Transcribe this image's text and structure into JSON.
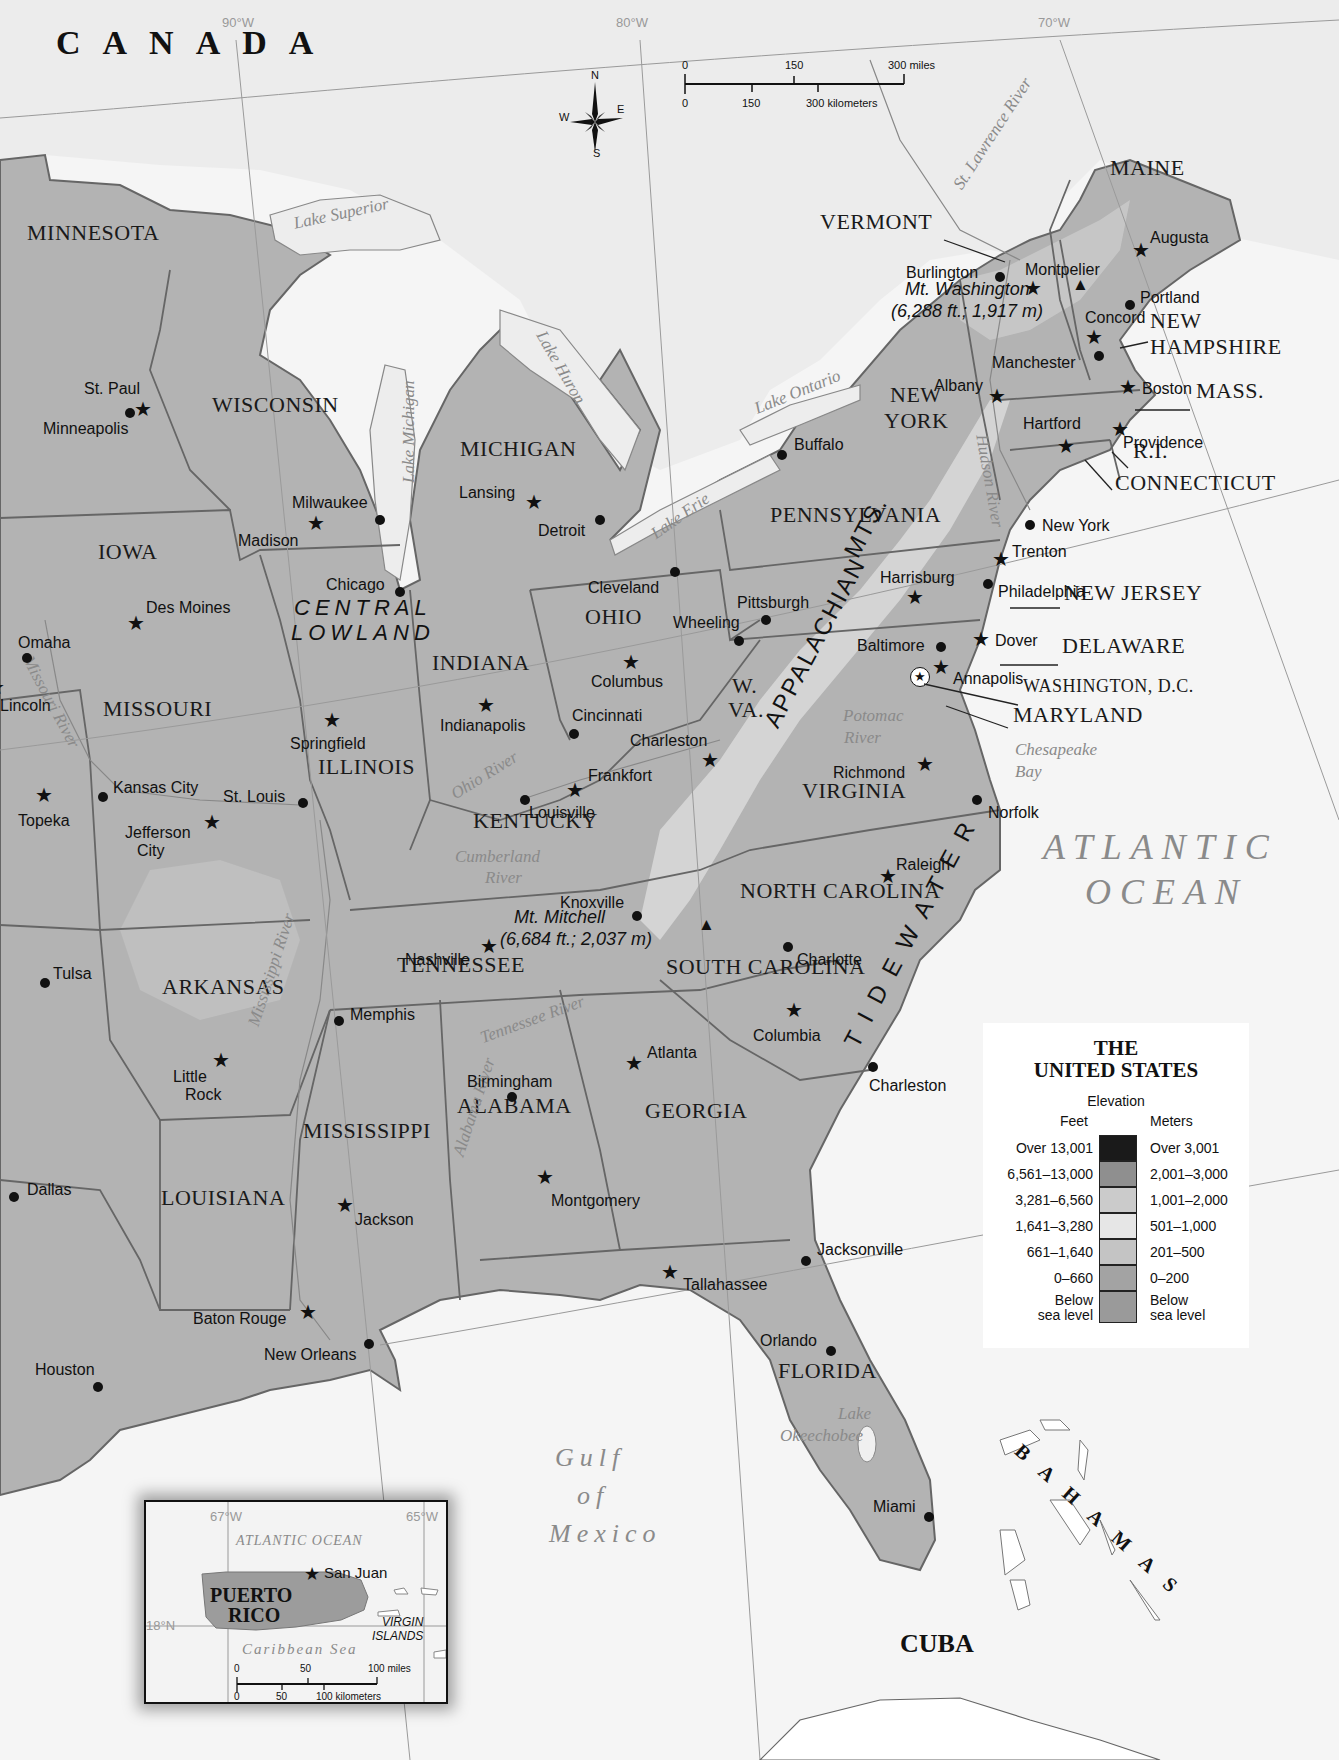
{
  "map": {
    "title": "THE UNITED STATES",
    "countries": [
      {
        "name": "CANADA",
        "x": 56,
        "y": 60,
        "size": 34,
        "spacing": 22
      },
      {
        "name": "CUBA",
        "x": 900,
        "y": 1657,
        "size": 26,
        "spacing": 0
      },
      {
        "name": "BAHAMAS",
        "x": 1025,
        "y": 1460,
        "size": 20,
        "spacing": 18,
        "rotate": 42
      }
    ],
    "oceans": [
      {
        "name": "ATLANTIC",
        "x": 1043,
        "y": 865
      },
      {
        "name": "OCEAN",
        "x": 1085,
        "y": 910
      }
    ],
    "gulf": {
      "lines": [
        "Gulf",
        "of",
        "Mexico"
      ],
      "x": 555,
      "y": 1445
    },
    "graticule": [
      {
        "label": "90°W",
        "x": 222,
        "y": 16
      },
      {
        "label": "80°W",
        "x": 616,
        "y": 16
      },
      {
        "label": "70°W",
        "x": 1038,
        "y": 16
      }
    ],
    "scale_bar": {
      "miles": [
        "0",
        "150",
        "300 miles"
      ],
      "kilometers": [
        "0",
        "150",
        "300 kilometers"
      ]
    },
    "compass": {
      "n": "N",
      "s": "S",
      "e": "E",
      "w": "W"
    },
    "states": [
      {
        "name": "MINNESOTA",
        "x": 27,
        "y": 242
      },
      {
        "name": "WISCONSIN",
        "x": 212,
        "y": 414
      },
      {
        "name": "MICHIGAN",
        "x": 460,
        "y": 458
      },
      {
        "name": "IOWA",
        "x": 98,
        "y": 561
      },
      {
        "name": "MISSOURI",
        "x": 103,
        "y": 718
      },
      {
        "name": "ILLINOIS",
        "x": 318,
        "y": 776
      },
      {
        "name": "INDIANA",
        "x": 432,
        "y": 672
      },
      {
        "name": "OHIO",
        "x": 585,
        "y": 626
      },
      {
        "name": "KENTUCKY",
        "x": 473,
        "y": 830
      },
      {
        "name": "TENNESSEE",
        "x": 397,
        "y": 974
      },
      {
        "name": "ARKANSAS",
        "x": 162,
        "y": 996
      },
      {
        "name": "MISSISSIPPI",
        "x": 303,
        "y": 1140
      },
      {
        "name": "LOUISIANA",
        "x": 161,
        "y": 1207
      },
      {
        "name": "ALABAMA",
        "x": 457,
        "y": 1115
      },
      {
        "name": "GEORGIA",
        "x": 645,
        "y": 1120
      },
      {
        "name": "FLORIDA",
        "x": 778,
        "y": 1380
      },
      {
        "name": "SOUTH CAROLINA",
        "x": 666,
        "y": 976
      },
      {
        "name": "NORTH CAROLINA",
        "x": 740,
        "y": 900
      },
      {
        "name": "VIRGINIA",
        "x": 802,
        "y": 800
      },
      {
        "name": "PENNSYLVANIA",
        "x": 770,
        "y": 524
      },
      {
        "name": "NEW",
        "x": 890,
        "y": 404
      },
      {
        "name": "YORK",
        "x": 884,
        "y": 430
      },
      {
        "name": "MAINE",
        "x": 1110,
        "y": 177
      },
      {
        "name": "VERMONT",
        "x": 820,
        "y": 231
      },
      {
        "name": "NEW",
        "x": 1150,
        "y": 330
      },
      {
        "name": "HAMPSHIRE",
        "x": 1150,
        "y": 356
      },
      {
        "name": "MASS.",
        "x": 1196,
        "y": 400
      },
      {
        "name": "R.I.",
        "x": 1133,
        "y": 460
      },
      {
        "name": "CONNECTICUT",
        "x": 1115,
        "y": 492
      },
      {
        "name": "NEW JERSEY",
        "x": 1064,
        "y": 602
      },
      {
        "name": "DELAWARE",
        "x": 1062,
        "y": 655
      },
      {
        "name": "WASHINGTON, D.C.",
        "x": 1023,
        "y": 697,
        "small": true
      },
      {
        "name": "MARYLAND",
        "x": 1013,
        "y": 724
      },
      {
        "name": "W.",
        "x": 732,
        "y": 695
      },
      {
        "name": "VA.",
        "x": 728,
        "y": 719
      }
    ],
    "regions": [
      {
        "name": "CENTRAL",
        "x": 294,
        "y": 617
      },
      {
        "name": "LOWLAND",
        "x": 291,
        "y": 642
      },
      {
        "name": "APPALACHIAN",
        "x": 760,
        "y": 740,
        "rotate": -62
      },
      {
        "name": "MTS.",
        "x": 840,
        "y": 570,
        "rotate": -62
      },
      {
        "name": "TIDEWATER",
        "x": 840,
        "y": 1060,
        "rotate": -62
      }
    ],
    "mountains": [
      {
        "name": "Mt. Washington",
        "elev": "(6,288 ft.; 1,917 m)",
        "x": 905,
        "y": 298,
        "mx": 1080,
        "my": 290
      },
      {
        "name": "Mt. Mitchell",
        "elev": "(6,684 ft.; 2,037 m)",
        "x": 514,
        "y": 926,
        "mx": 706,
        "my": 930
      }
    ],
    "waters": [
      {
        "name": "Lake Superior",
        "x": 292,
        "y": 232,
        "rotate": -12
      },
      {
        "name": "Lake Michigan",
        "x": 400,
        "y": 500,
        "rotate": -90
      },
      {
        "name": "Lake Huron",
        "x": 548,
        "y": 345,
        "rotate": 60
      },
      {
        "name": "Lake Ontario",
        "x": 752,
        "y": 418,
        "rotate": -22
      },
      {
        "name": "Lake Erie",
        "x": 648,
        "y": 545,
        "rotate": -35
      },
      {
        "name": "St. Lawrence River",
        "x": 950,
        "y": 200,
        "rotate": -57
      },
      {
        "name": "Hudson River",
        "x": 990,
        "y": 450,
        "rotate": 80
      },
      {
        "name": "Missouri River",
        "x": 35,
        "y": 670,
        "rotate": 62
      },
      {
        "name": "Ohio River",
        "x": 448,
        "y": 805,
        "rotate": -32
      },
      {
        "name": "Cumberland",
        "x": 455,
        "y": 865,
        "rotate": 0
      },
      {
        "name": "River",
        "x": 485,
        "y": 886,
        "rotate": 0
      },
      {
        "name": "Potomac",
        "x": 843,
        "y": 724,
        "rotate": 0
      },
      {
        "name": "River",
        "x": 844,
        "y": 746,
        "rotate": 0
      },
      {
        "name": "Chesapeake",
        "x": 1015,
        "y": 758,
        "rotate": 0
      },
      {
        "name": "Bay",
        "x": 1015,
        "y": 780,
        "rotate": 0
      },
      {
        "name": "Mississippi River",
        "x": 245,
        "y": 1040,
        "rotate": -72
      },
      {
        "name": "Tennessee River",
        "x": 478,
        "y": 1047,
        "rotate": -20
      },
      {
        "name": "Alabama River",
        "x": 450,
        "y": 1170,
        "rotate": -72
      },
      {
        "name": "Lake",
        "x": 838,
        "y": 1422,
        "rotate": 0
      },
      {
        "name": "Okeechobee",
        "x": 780,
        "y": 1444,
        "rotate": 0
      }
    ],
    "cities": [
      {
        "name": "St. Paul",
        "type": "capital",
        "mx": 143,
        "my": 410,
        "lx": 84,
        "ly": 381
      },
      {
        "name": "Minneapolis",
        "type": "city",
        "mx": 130,
        "my": 413,
        "lx": 43,
        "ly": 421
      },
      {
        "name": "Madison",
        "type": "capital",
        "mx": 316,
        "my": 524,
        "lx": 238,
        "ly": 533
      },
      {
        "name": "Milwaukee",
        "type": "city",
        "mx": 380,
        "my": 520,
        "lx": 292,
        "ly": 495
      },
      {
        "name": "Chicago",
        "type": "city",
        "mx": 400,
        "my": 592,
        "lx": 326,
        "ly": 577
      },
      {
        "name": "Lansing",
        "type": "capital",
        "mx": 534,
        "my": 503,
        "lx": 459,
        "ly": 485
      },
      {
        "name": "Detroit",
        "type": "city",
        "mx": 600,
        "my": 520,
        "lx": 538,
        "ly": 523
      },
      {
        "name": "Cleveland",
        "type": "city",
        "mx": 675,
        "my": 572,
        "lx": 588,
        "ly": 580
      },
      {
        "name": "Buffalo",
        "type": "city",
        "mx": 782,
        "my": 455,
        "lx": 794,
        "ly": 437
      },
      {
        "name": "Des Moines",
        "type": "capital",
        "mx": 136,
        "my": 624,
        "lx": 146,
        "ly": 600
      },
      {
        "name": "Omaha",
        "type": "city",
        "mx": 27,
        "my": 658,
        "lx": 18,
        "ly": 635
      },
      {
        "name": "Lincoln",
        "type": "capital",
        "mx": -4,
        "my": 688,
        "lx": 0,
        "ly": 698
      },
      {
        "name": "Springfield",
        "type": "capital",
        "mx": 332,
        "my": 721,
        "lx": 290,
        "ly": 736
      },
      {
        "name": "Indianapolis",
        "type": "capital",
        "mx": 486,
        "my": 706,
        "lx": 440,
        "ly": 718
      },
      {
        "name": "Columbus",
        "type": "capital",
        "mx": 631,
        "my": 663,
        "lx": 591,
        "ly": 674
      },
      {
        "name": "Pittsburgh",
        "type": "city",
        "mx": 766,
        "my": 620,
        "lx": 737,
        "ly": 595
      },
      {
        "name": "Wheeling",
        "type": "city",
        "mx": 739,
        "my": 641,
        "lx": 673,
        "ly": 615
      },
      {
        "name": "Harrisburg",
        "type": "capital",
        "mx": 915,
        "my": 598,
        "lx": 880,
        "ly": 570
      },
      {
        "name": "Philadelphia",
        "type": "city",
        "mx": 988,
        "my": 584,
        "lx": 998,
        "ly": 584
      },
      {
        "name": "Trenton",
        "type": "capital",
        "mx": 1001,
        "my": 560,
        "lx": 1012,
        "ly": 544
      },
      {
        "name": "New York",
        "type": "city",
        "mx": 1030,
        "my": 525,
        "lx": 1042,
        "ly": 518
      },
      {
        "name": "Albany",
        "type": "capital",
        "mx": 997,
        "my": 397,
        "lx": 934,
        "ly": 378
      },
      {
        "name": "Hartford",
        "type": "capital",
        "mx": 1066,
        "my": 447,
        "lx": 1023,
        "ly": 416
      },
      {
        "name": "Providence",
        "type": "capital",
        "mx": 1120,
        "my": 430,
        "lx": 1123,
        "ly": 435
      },
      {
        "name": "Boston",
        "type": "capital",
        "mx": 1128,
        "my": 388,
        "lx": 1142,
        "ly": 381
      },
      {
        "name": "Manchester",
        "type": "city",
        "mx": 1099,
        "my": 356,
        "lx": 992,
        "ly": 355
      },
      {
        "name": "Concord",
        "type": "capital",
        "mx": 1094,
        "my": 338,
        "lx": 1085,
        "ly": 310
      },
      {
        "name": "Portland",
        "type": "city",
        "mx": 1130,
        "my": 305,
        "lx": 1140,
        "ly": 290
      },
      {
        "name": "Augusta",
        "type": "capital",
        "mx": 1141,
        "my": 251,
        "lx": 1150,
        "ly": 230
      },
      {
        "name": "Montpelier",
        "type": "capital",
        "mx": 1033,
        "my": 289,
        "lx": 1025,
        "ly": 262
      },
      {
        "name": "Burlington",
        "type": "city",
        "mx": 1000,
        "my": 277,
        "lx": 906,
        "ly": 265
      },
      {
        "name": "Baltimore",
        "type": "city",
        "mx": 941,
        "my": 647,
        "lx": 857,
        "ly": 638
      },
      {
        "name": "Dover",
        "type": "capital",
        "mx": 981,
        "my": 640,
        "lx": 995,
        "ly": 633
      },
      {
        "name": "Annapolis",
        "type": "capital",
        "mx": 941,
        "my": 668,
        "lx": 953,
        "ly": 671
      },
      {
        "name": "Washington, D.C.",
        "type": "national",
        "mx": 920,
        "my": 677,
        "hide_label": true
      },
      {
        "name": "Richmond",
        "type": "capital",
        "mx": 925,
        "my": 765,
        "lx": 833,
        "ly": 765
      },
      {
        "name": "Norfolk",
        "type": "city",
        "mx": 977,
        "my": 800,
        "lx": 988,
        "ly": 805
      },
      {
        "name": "Charleston",
        "type": "capital",
        "mx": 710,
        "my": 761,
        "lx": 630,
        "ly": 733
      },
      {
        "name": "Cincinnati",
        "type": "city",
        "mx": 574,
        "my": 734,
        "lx": 572,
        "ly": 708
      },
      {
        "name": "Frankfort",
        "type": "capital",
        "mx": 575,
        "my": 791,
        "lx": 588,
        "ly": 768
      },
      {
        "name": "Louisville",
        "type": "city",
        "mx": 525,
        "my": 800,
        "lx": 529,
        "ly": 805
      },
      {
        "name": "Topeka",
        "type": "capital",
        "mx": 44,
        "my": 796,
        "lx": 18,
        "ly": 813
      },
      {
        "name": "Kansas City",
        "type": "city",
        "mx": 103,
        "my": 797,
        "lx": 113,
        "ly": 780
      },
      {
        "name": "Jefferson City",
        "type": "capital",
        "mx": 212,
        "my": 823,
        "lx": 125,
        "ly": 825,
        "wrap": [
          "Jefferson",
          "City"
        ]
      },
      {
        "name": "St. Louis",
        "type": "city",
        "mx": 303,
        "my": 803,
        "lx": 223,
        "ly": 789
      },
      {
        "name": "Knoxville",
        "type": "city",
        "mx": 637,
        "my": 916,
        "lx": 560,
        "ly": 895
      },
      {
        "name": "Nashville",
        "type": "capital",
        "mx": 489,
        "my": 947,
        "lx": 405,
        "ly": 952
      },
      {
        "name": "Raleigh",
        "type": "capital",
        "mx": 888,
        "my": 877,
        "lx": 896,
        "ly": 857
      },
      {
        "name": "Charlotte",
        "type": "city",
        "mx": 788,
        "my": 947,
        "lx": 797,
        "ly": 952
      },
      {
        "name": "Columbia",
        "type": "capital",
        "mx": 794,
        "my": 1011,
        "lx": 753,
        "ly": 1028
      },
      {
        "name": "Charleston",
        "type": "city",
        "mx": 873,
        "my": 1067,
        "lx": 869,
        "ly": 1078
      },
      {
        "name": "Tulsa",
        "type": "city",
        "mx": 45,
        "my": 983,
        "lx": 53,
        "ly": 966
      },
      {
        "name": "Memphis",
        "type": "city",
        "mx": 339,
        "my": 1021,
        "lx": 350,
        "ly": 1007
      },
      {
        "name": "Little Rock",
        "type": "capital",
        "mx": 221,
        "my": 1061,
        "lx": 173,
        "ly": 1069,
        "wrap": [
          "Little",
          "Rock"
        ]
      },
      {
        "name": "Birmingham",
        "type": "city",
        "mx": 512,
        "my": 1097,
        "lx": 467,
        "ly": 1074
      },
      {
        "name": "Atlanta",
        "type": "capital",
        "mx": 634,
        "my": 1064,
        "lx": 647,
        "ly": 1045
      },
      {
        "name": "Montgomery",
        "type": "capital",
        "mx": 545,
        "my": 1178,
        "lx": 551,
        "ly": 1193
      },
      {
        "name": "Jackson",
        "type": "capital",
        "mx": 345,
        "my": 1206,
        "lx": 355,
        "ly": 1212
      },
      {
        "name": "Dallas",
        "type": "city",
        "mx": 14,
        "my": 1197,
        "lx": 27,
        "ly": 1182
      },
      {
        "name": "Baton Rouge",
        "type": "capital",
        "mx": 308,
        "my": 1313,
        "lx": 193,
        "ly": 1311
      },
      {
        "name": "New Orleans",
        "type": "city",
        "mx": 369,
        "my": 1344,
        "lx": 264,
        "ly": 1347
      },
      {
        "name": "Houston",
        "type": "city",
        "mx": 98,
        "my": 1387,
        "lx": 35,
        "ly": 1362
      },
      {
        "name": "Tallahassee",
        "type": "capital",
        "mx": 670,
        "my": 1273,
        "lx": 683,
        "ly": 1277
      },
      {
        "name": "Jacksonville",
        "type": "city",
        "mx": 806,
        "my": 1261,
        "lx": 817,
        "ly": 1242
      },
      {
        "name": "Orlando",
        "type": "city",
        "mx": 831,
        "my": 1351,
        "lx": 760,
        "ly": 1333
      },
      {
        "name": "Miami",
        "type": "city",
        "mx": 929,
        "my": 1517,
        "lx": 873,
        "ly": 1499
      }
    ]
  },
  "legend": {
    "title_line1": "THE",
    "title_line2": "UNITED STATES",
    "subtitle": "Elevation",
    "feet_header": "Feet",
    "meters_header": "Meters",
    "rows": [
      {
        "feet": "Over 13,001",
        "meters": "Over 3,001",
        "color": "#1a1a1a"
      },
      {
        "feet": "6,561–13,000",
        "meters": "2,001–3,000",
        "color": "#8f8f8f"
      },
      {
        "feet": "3,281–6,560",
        "meters": "1,001–2,000",
        "color": "#cbcbcb"
      },
      {
        "feet": "1,641–3,280",
        "meters": "501–1,000",
        "color": "#e6e6e6"
      },
      {
        "feet": "661–1,640",
        "meters": "201–500",
        "color": "#c4c4c4"
      },
      {
        "feet": "0–660",
        "meters": "0–200",
        "color": "#a3a3a3"
      },
      {
        "feet": "Below sea level",
        "meters": "Below sea level",
        "color": "#9a9a9a",
        "feet_lines": [
          "Below",
          "sea level"
        ],
        "meters_lines": [
          "Below",
          "sea level"
        ]
      }
    ]
  },
  "inset": {
    "title_line1": "PUERTO",
    "title_line2": "RICO",
    "capital": "San Juan",
    "atlantic": "ATLANTIC OCEAN",
    "caribbean": "Caribbean Sea",
    "islands_line1": "VIRGIN",
    "islands_line2": "ISLANDS",
    "lon_left": "67°W",
    "lon_right": "65°W",
    "lat": "18°N",
    "scale_miles": [
      "0",
      "50",
      "100 miles"
    ],
    "scale_km": [
      "0",
      "50",
      "100 kilometers"
    ]
  },
  "colors": {
    "land_low": "#a9a9a9",
    "land_mid": "#c6c6c6",
    "land_high": "#dcdcdc",
    "water": "#f6f6f6",
    "border": "#555555"
  }
}
